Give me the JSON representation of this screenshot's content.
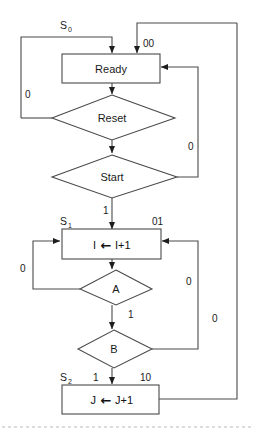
{
  "diagram": {
    "nodes": {
      "ready": {
        "label": "Ready",
        "state_label": "S",
        "state_sub": "0"
      },
      "reset": {
        "label": "Reset"
      },
      "start": {
        "label": "Start"
      },
      "incr_i": {
        "label_left": "I",
        "label_arrow": "←",
        "label_right": "I+1",
        "state_label": "S",
        "state_sub": "1"
      },
      "cond_a": {
        "label": "A"
      },
      "cond_b": {
        "label": "B"
      },
      "incr_j": {
        "label_left": "J",
        "label_arrow": "←",
        "label_right": "J+1",
        "state_label": "S",
        "state_sub": "2"
      }
    },
    "edge_labels": {
      "ready_output": "00",
      "incr_i_output": "01",
      "incr_j_output": "10",
      "reset_false": "0",
      "reset_true_branch": "0",
      "start_false": "0",
      "start_true": "1",
      "cond_a_false": "0",
      "cond_a_true": "1",
      "cond_b_false": "0",
      "cond_b_true": "1",
      "outer_return": "0"
    },
    "colors": {
      "stroke": "#4a4a4a",
      "text": "#1a1a1a",
      "background": "#ffffff",
      "rule": "#b9b9b9"
    }
  }
}
